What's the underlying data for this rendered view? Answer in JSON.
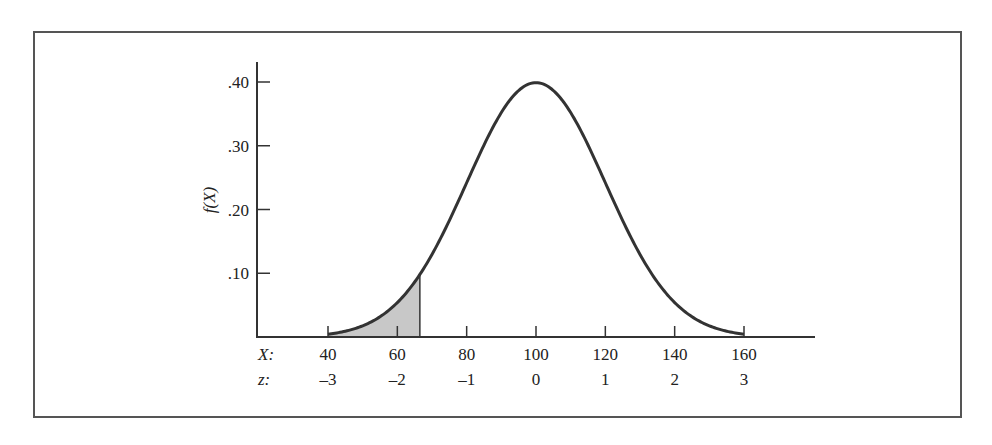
{
  "chart_data": {
    "type": "area",
    "title": "",
    "subtitle": "",
    "xlabel": "X",
    "ylabel": "f(X)",
    "secondary_xlabel": "z",
    "distribution": {
      "family": "normal",
      "mean": 100,
      "sd": 20
    },
    "x_ticks": [
      40,
      60,
      80,
      100,
      120,
      140,
      160
    ],
    "z_ticks": [
      "–3",
      "–2",
      "–1",
      "0",
      "1",
      "2",
      "3"
    ],
    "y_ticks": [
      ".10",
      ".20",
      ".30",
      ".40"
    ],
    "y_tick_values": [
      0.1,
      0.2,
      0.3,
      0.4
    ],
    "xlim": [
      20,
      180
    ],
    "ylim": [
      0,
      0.43
    ],
    "grid": false,
    "legend": "none",
    "y_scale_note": "f(X) values are in standardized (z) density units",
    "curve_points": {
      "x": [
        40,
        50,
        60,
        70,
        80,
        90,
        100,
        110,
        120,
        130,
        140,
        150,
        160
      ],
      "y": [
        0.004,
        0.018,
        0.054,
        0.13,
        0.242,
        0.352,
        0.399,
        0.352,
        0.242,
        0.13,
        0.054,
        0.018,
        0.004
      ]
    },
    "shaded_region": {
      "from_x": 40,
      "to_x": 66.5,
      "from_z": -3,
      "to_z": -1.67,
      "fill": "#c8c8c8"
    }
  },
  "labels": {
    "y_axis_title": "f(X)",
    "x_row_label": "X:",
    "z_row_label": "z:"
  },
  "colors": {
    "curve": "#333333",
    "shade": "#c8c8c8",
    "axis": "#333333",
    "frame": "#555555"
  }
}
